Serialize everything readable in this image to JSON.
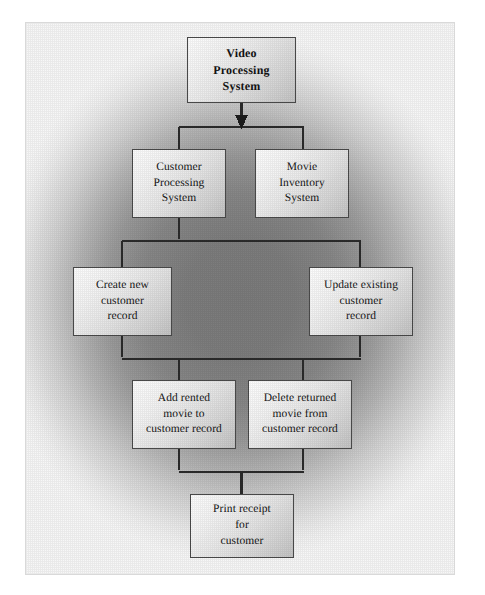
{
  "diagram": {
    "type": "hierarchy-flowchart",
    "background": {
      "center_color": "#7b7b7b",
      "edge_color": "#f7f7f7",
      "frame_border_color": "#d9d9d9",
      "page_color": "#ffffff"
    },
    "style": {
      "box_border_color": "#4a4a4a",
      "box_fill_light": "#fdfdfd",
      "box_fill_dark": "#c4c4c4",
      "connector_color": "#2b2b2b",
      "text_color": "#141414"
    },
    "nodes": [
      {
        "id": "root",
        "name": "video-processing-system",
        "lines": [
          "Video",
          "Processing",
          "System"
        ],
        "bold": true,
        "level": 1,
        "x": 186,
        "y": 36,
        "w": 109,
        "h": 66
      },
      {
        "id": "customer-processing",
        "name": "customer-processing-system",
        "lines": [
          "Customer",
          "Processing",
          "System"
        ],
        "bold": false,
        "level": 2,
        "x": 131,
        "y": 148,
        "w": 94,
        "h": 69
      },
      {
        "id": "movie-inventory",
        "name": "movie-inventory-system",
        "lines": [
          "Movie",
          "Inventory",
          "System"
        ],
        "bold": false,
        "level": 2,
        "x": 254,
        "y": 148,
        "w": 94,
        "h": 69
      },
      {
        "id": "create-customer",
        "name": "create-new-customer-record",
        "lines": [
          "Create new",
          "customer",
          "record"
        ],
        "bold": false,
        "level": 3,
        "x": 72,
        "y": 266,
        "w": 99,
        "h": 69
      },
      {
        "id": "update-customer",
        "name": "update-existing-customer-record",
        "lines": [
          "Update existing",
          "customer",
          "record"
        ],
        "bold": false,
        "level": 3,
        "x": 308,
        "y": 266,
        "w": 104,
        "h": 69
      },
      {
        "id": "add-rented-movie",
        "name": "add-rented-movie-to-customer-record",
        "lines": [
          "Add rented",
          "movie to",
          "customer record"
        ],
        "bold": false,
        "level": 4,
        "x": 131,
        "y": 379,
        "w": 104,
        "h": 69
      },
      {
        "id": "delete-returned-movie",
        "name": "delete-returned-movie-from-customer-record",
        "lines": [
          "Delete returned",
          "movie from",
          "customer record"
        ],
        "bold": false,
        "level": 4,
        "x": 247,
        "y": 379,
        "w": 104,
        "h": 69
      },
      {
        "id": "print-receipt",
        "name": "print-receipt-for-customer",
        "lines": [
          "Print receipt",
          "for",
          "customer"
        ],
        "bold": false,
        "level": 5,
        "x": 189,
        "y": 493,
        "w": 104,
        "h": 64
      }
    ],
    "edges": [
      {
        "from": "root",
        "to": "bus-level-2",
        "has_arrowhead": true
      },
      {
        "from": "bus-level-2",
        "to": "customer-processing",
        "has_arrowhead": false
      },
      {
        "from": "bus-level-2",
        "to": "movie-inventory",
        "has_arrowhead": false
      },
      {
        "from": "customer-processing",
        "to": "bus-level-3",
        "has_arrowhead": false
      },
      {
        "from": "bus-level-3",
        "to": "create-customer",
        "has_arrowhead": false
      },
      {
        "from": "bus-level-3",
        "to": "update-customer",
        "has_arrowhead": false
      },
      {
        "from": "create-customer",
        "to": "bus-level-4",
        "has_arrowhead": false
      },
      {
        "from": "update-customer",
        "to": "bus-level-4",
        "has_arrowhead": false
      },
      {
        "from": "bus-level-4",
        "to": "add-rented-movie",
        "has_arrowhead": false
      },
      {
        "from": "bus-level-4",
        "to": "delete-returned-movie",
        "has_arrowhead": false
      },
      {
        "from": "add-rented-movie",
        "to": "bus-level-5",
        "has_arrowhead": false
      },
      {
        "from": "delete-returned-movie",
        "to": "bus-level-5",
        "has_arrowhead": false
      },
      {
        "from": "bus-level-5",
        "to": "print-receipt",
        "has_arrowhead": false
      }
    ]
  }
}
